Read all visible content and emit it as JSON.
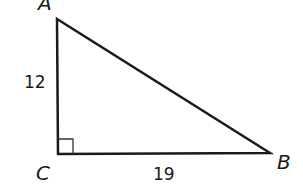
{
  "diagram": {
    "type": "right-triangle",
    "vertices": [
      {
        "name": "A",
        "label": "A"
      },
      {
        "name": "B",
        "label": "B"
      },
      {
        "name": "C",
        "label": "C"
      }
    ],
    "sides": [
      {
        "between": "AC",
        "label": "12"
      },
      {
        "between": "CB",
        "label": "19"
      }
    ],
    "right_angle_at": "C",
    "stroke_color": "#1a1a1a"
  }
}
